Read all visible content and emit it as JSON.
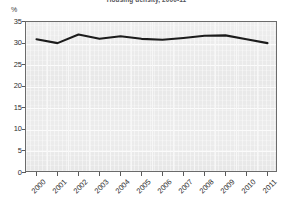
{
  "chart_data": {
    "type": "line",
    "title": "Housing density, 2000-11",
    "ylabel": "%",
    "xlabel": "",
    "categories": [
      "2000",
      "2001",
      "2002",
      "2003",
      "2004",
      "2005",
      "2006",
      "2007",
      "2008",
      "2009",
      "2010",
      "2011"
    ],
    "values": [
      31.0,
      30.1,
      32.1,
      31.1,
      31.7,
      31.1,
      30.9,
      31.3,
      31.8,
      31.9,
      31.0,
      30.1
    ],
    "series": [
      {
        "name": "share",
        "values": [
          31.0,
          30.1,
          32.1,
          31.1,
          31.7,
          31.1,
          30.9,
          31.3,
          31.8,
          31.9,
          31.0,
          30.1
        ]
      }
    ],
    "ylim": [
      0,
      35
    ],
    "yticks": [
      0,
      5,
      10,
      15,
      20,
      25,
      30,
      35
    ],
    "ytick_labels": [
      "0",
      "5",
      "10",
      "15",
      "20",
      "25",
      "30",
      "35"
    ],
    "grid": true,
    "legend": "none",
    "line_color": "#1c1c1c",
    "plot_background": "#ececec"
  }
}
